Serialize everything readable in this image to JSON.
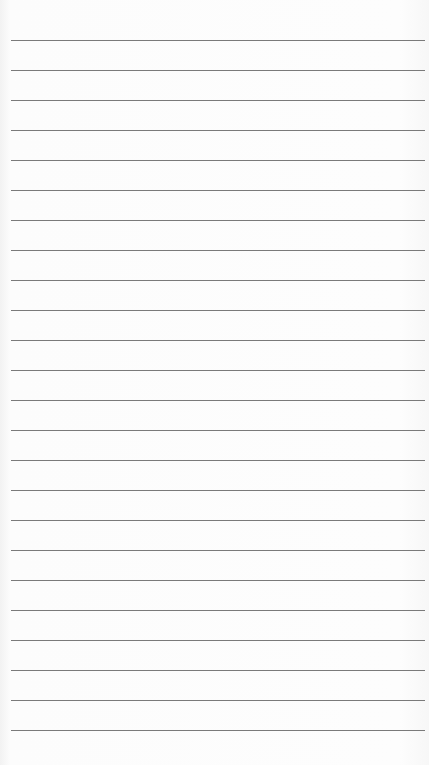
{
  "paper": {
    "type": "lined-notepaper",
    "background_color": "#fbfbfb",
    "rule_color": "#7a7a7a",
    "rule_count": 24,
    "first_rule_y": 40,
    "rule_spacing": 30,
    "rule_left": 11,
    "rule_right": 425,
    "text": ""
  }
}
